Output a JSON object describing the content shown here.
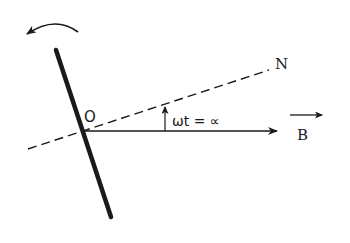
{
  "diagram": {
    "labels": {
      "origin": "O",
      "normal": "N",
      "angle": "ωt = ∝",
      "field": "B"
    },
    "colors": {
      "ink": "#1a1a1a",
      "background": "#ffffff"
    },
    "elements": [
      {
        "name": "coil-plane",
        "style": "thick-solid"
      },
      {
        "name": "normal-line",
        "style": "dashed"
      },
      {
        "name": "field-direction-line",
        "style": "solid-arrow"
      },
      {
        "name": "angle-arrow",
        "style": "solid-arrow"
      },
      {
        "name": "rotation-arrow",
        "style": "curved-arrow"
      }
    ]
  }
}
